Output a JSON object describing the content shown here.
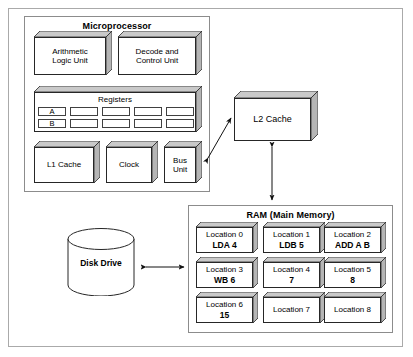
{
  "diagram": {
    "colors": {
      "block_top": "#c9c9c9",
      "block_side": "#b5b5b5",
      "block_face": "#ffffff",
      "outline": "#262626",
      "group_border": "#8c8c8c",
      "outer_border": "#aaaaaa",
      "arrow": "#111111"
    }
  },
  "microprocessor": {
    "title": "Microprocessor",
    "blocks": [
      {
        "name": "alu",
        "lines": [
          "Arithmetic",
          "Logic Unit"
        ]
      },
      {
        "name": "decode-control",
        "lines": [
          "Decode and",
          "Control Unit"
        ]
      },
      {
        "name": "l1-cache",
        "lines": [
          "L1 Cache"
        ]
      },
      {
        "name": "clock",
        "lines": [
          "Clock"
        ]
      },
      {
        "name": "bus-unit",
        "lines": [
          "Bus",
          "Unit"
        ]
      }
    ],
    "registers": {
      "title": "Registers",
      "rows": [
        [
          "A",
          "",
          "",
          "",
          ""
        ],
        [
          "B",
          "",
          "",
          "",
          ""
        ]
      ]
    }
  },
  "l2_cache": {
    "label": "L2 Cache"
  },
  "disk_drive": {
    "label": "Disk Drive"
  },
  "ram": {
    "title": "RAM (Main Memory)",
    "cells": [
      {
        "location": "Location 0",
        "value": "LDA 4"
      },
      {
        "location": "Location 1",
        "value": "LDB 5"
      },
      {
        "location": "Location 2",
        "value": "ADD A B"
      },
      {
        "location": "Location 3",
        "value": "WB 6"
      },
      {
        "location": "Location 4",
        "value": "7"
      },
      {
        "location": "Location 5",
        "value": "8"
      },
      {
        "location": "Location 6",
        "value": "15"
      },
      {
        "location": "Location 7",
        "value": ""
      },
      {
        "location": "Location 8",
        "value": ""
      }
    ]
  },
  "connections": [
    {
      "name": "bus-unit-to-l2-cache",
      "type": "double-arrow",
      "orientation": "diagonal"
    },
    {
      "name": "l2-cache-to-ram",
      "type": "double-arrow",
      "orientation": "vertical"
    },
    {
      "name": "disk-drive-to-ram",
      "type": "double-arrow",
      "orientation": "horizontal"
    }
  ]
}
